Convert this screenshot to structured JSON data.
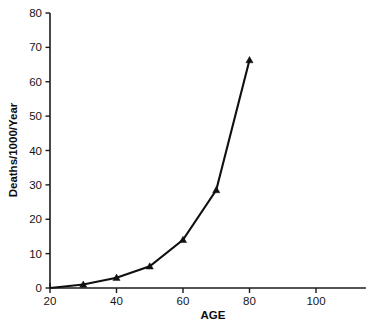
{
  "chart_data": {
    "type": "line",
    "title": "",
    "subtitle": "",
    "xlabel": "AGE",
    "ylabel": "Deaths/1000/Year",
    "xlim": [
      20,
      115
    ],
    "ylim": [
      0,
      80
    ],
    "xticks": [
      20,
      40,
      60,
      80,
      100
    ],
    "yticks": [
      0,
      10,
      20,
      30,
      40,
      50,
      60,
      70,
      80
    ],
    "xtick_labels": [
      "20",
      "40",
      "60",
      "80",
      "100"
    ],
    "ytick_labels": [
      "0",
      "10",
      "20",
      "30",
      "40",
      "50",
      "60",
      "70",
      "80"
    ],
    "grid": false,
    "legend": null,
    "legend_position": "none",
    "marker": "triangle",
    "line_color": "#101010",
    "marker_color": "#101010",
    "background_color": "#ffffff",
    "x": [
      20,
      30,
      40,
      50,
      60,
      70,
      80
    ],
    "values": [
      0,
      1.0,
      3.0,
      6.3,
      14.0,
      28.5,
      66.3
    ],
    "series": [
      {
        "name": "Deaths per 1000 per year",
        "x": [
          20,
          30,
          40,
          50,
          60,
          70,
          80
        ],
        "values": [
          0,
          1.0,
          3.0,
          6.3,
          14.0,
          28.5,
          66.3
        ]
      }
    ],
    "annotations": []
  },
  "axes": {
    "x_axis_name": "AGE",
    "y_axis_name": "Deaths/1000/Year"
  }
}
